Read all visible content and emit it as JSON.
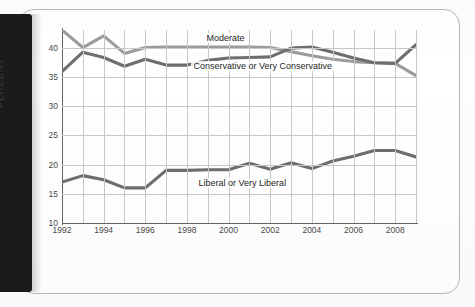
{
  "page": {
    "spine_color": "#1b1b1b",
    "sheet_color": "#ffffff"
  },
  "chart_data": {
    "type": "line",
    "title": "",
    "subtitle": "",
    "xlabel": "",
    "ylabel": "PERCENT",
    "xlim": [
      1992,
      2009
    ],
    "ylim": [
      10,
      43
    ],
    "grid": true,
    "legend_position": "inline-annotations",
    "y_ticks": [
      40,
      35,
      30,
      25,
      20,
      15,
      10
    ],
    "y_tick_labels": [
      "40",
      "35",
      "30",
      "25",
      "20",
      "15",
      "10"
    ],
    "x_ticks": [
      1992,
      1994,
      1996,
      1998,
      2000,
      2002,
      2004,
      2006,
      2008
    ],
    "x_tick_labels": [
      "1992",
      "1994",
      "1996",
      "1998",
      "2000",
      "2002",
      "2004",
      "2006",
      "2008"
    ],
    "x": [
      1992,
      1993,
      1994,
      1995,
      1996,
      1997,
      1998,
      1999,
      2000,
      2001,
      2002,
      2003,
      2004,
      2005,
      2006,
      2007,
      2008,
      2009
    ],
    "series": [
      {
        "name": "Moderate",
        "color": "#9c9c9c",
        "label_text": "Moderate",
        "values": [
          43.0,
          40.0,
          42.0,
          39.0,
          40.0,
          40.1,
          40.1,
          40.1,
          40.1,
          40.1,
          40.0,
          39.3,
          38.6,
          38.0,
          37.6,
          37.4,
          37.3,
          35.2
        ]
      },
      {
        "name": "Conservative or Very Conservative",
        "color": "#6e6e6e",
        "label_text": "Conservative or Very Conservative",
        "values": [
          35.9,
          39.2,
          38.3,
          36.8,
          38.0,
          37.0,
          37.0,
          37.8,
          38.2,
          38.3,
          38.4,
          39.9,
          40.1,
          39.2,
          38.2,
          37.4,
          37.3,
          40.5
        ]
      },
      {
        "name": "Liberal or Very Liberal",
        "color": "#6e6e6e",
        "label_text": "Liberal or Very Liberal",
        "values": [
          17.0,
          18.1,
          17.4,
          16.0,
          16.0,
          19.0,
          19.0,
          19.1,
          19.1,
          20.2,
          19.2,
          20.3,
          19.3,
          20.6,
          21.4,
          22.4,
          22.4,
          21.3
        ]
      }
    ]
  },
  "annotations": {
    "moderate_label": "Moderate",
    "conservative_label": "Conservative or Very Conservative",
    "liberal_label": "Liberal or Very Liberal"
  }
}
